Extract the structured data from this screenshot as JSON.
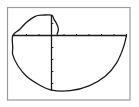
{
  "chart_data": {
    "type": "line",
    "title": "",
    "subtitle": "",
    "xlabel": "",
    "ylabel": "",
    "grid": false,
    "legend": null,
    "axes": {
      "x": {
        "tick_count_left_of_origin": 3,
        "tick_count_right_of_origin": 6,
        "tick_spacing_units": 1,
        "range": [
          -3,
          6
        ]
      },
      "y": {
        "tick_count_above_origin": 1.6,
        "tick_count_below_origin": 4.5,
        "tick_spacing_units": 1,
        "range": [
          -4.6,
          1.7
        ]
      }
    },
    "series": [
      {
        "name": "spiral",
        "points": [
          [
            0.45,
            0.1
          ],
          [
            0.55,
            0.5
          ],
          [
            0.45,
            0.9
          ],
          [
            0.2,
            1.35
          ],
          [
            0.0,
            1.7
          ],
          [
            -0.7,
            1.7
          ],
          [
            -1.3,
            1.6
          ],
          [
            -2.0,
            1.1
          ],
          [
            -2.55,
            0.5
          ],
          [
            -3.1,
            0.0
          ],
          [
            -3.1,
            -1.0
          ],
          [
            -3.1,
            -1.6
          ],
          [
            -2.7,
            -2.5
          ],
          [
            -2.0,
            -3.4
          ],
          [
            -1.0,
            -4.1
          ],
          [
            0.0,
            -4.55
          ],
          [
            1.5,
            -4.6
          ],
          [
            3.0,
            -4.2
          ],
          [
            4.3,
            -3.4
          ],
          [
            5.2,
            -2.3
          ],
          [
            5.75,
            -1.0
          ],
          [
            6.0,
            0.0
          ]
        ]
      }
    ]
  },
  "screen": {
    "frame_color": "#9a9a9a",
    "axis_color": "#1a1a1a",
    "curve_color": "#1a1a1a",
    "background": "#ffffff"
  }
}
